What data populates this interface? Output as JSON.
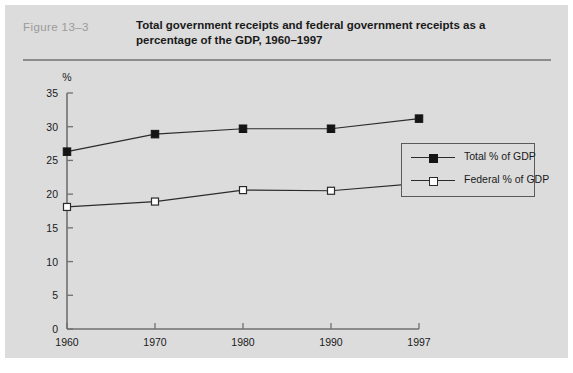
{
  "figure": {
    "number_label": "Figure  13–3",
    "title": "Total government receipts and federal government receipts as a percentage of the GDP, 1960–1997"
  },
  "legend": {
    "position": "inside-right",
    "items": [
      {
        "label": "Total % of GDP",
        "marker": "filled-square",
        "color": "#141414"
      },
      {
        "label": "Federal % of GDP",
        "marker": "open-square",
        "color": "#2b2b2b"
      }
    ]
  },
  "colors": {
    "panel_background": "#dcdcdc",
    "page_background": "#ffffff",
    "axis": "#707070",
    "rule": "#8c8c8c",
    "figure_number_text": "#9a9a9a",
    "title_text": "#1a1a1a",
    "series_line": "#2b2b2b"
  },
  "chart_data": {
    "type": "line",
    "title": "Total government receipts and federal government receipts as a percentage of the GDP, 1960–1997",
    "xlabel": "",
    "ylabel": "%",
    "y_unit_label": "%",
    "categories": [
      "1960",
      "1970",
      "1980",
      "1990",
      "1997"
    ],
    "x": [
      1960,
      1970,
      1980,
      1990,
      1997
    ],
    "xtick_labels": [
      "1960",
      "1970",
      "1980",
      "1990",
      "1997"
    ],
    "ytick_labels": [
      "0",
      "5",
      "10",
      "15",
      "20",
      "25",
      "30",
      "35"
    ],
    "yticks": [
      0,
      5,
      10,
      15,
      20,
      25,
      30,
      35
    ],
    "ylim": [
      0,
      35
    ],
    "grid": false,
    "series": [
      {
        "name": "Total % of GDP",
        "marker": "filled-square",
        "values": [
          26.3,
          28.9,
          29.7,
          29.7,
          31.2
        ]
      },
      {
        "name": "Federal % of GDP",
        "marker": "open-square",
        "values": [
          18.1,
          18.9,
          20.6,
          20.5,
          21.6
        ]
      }
    ]
  }
}
